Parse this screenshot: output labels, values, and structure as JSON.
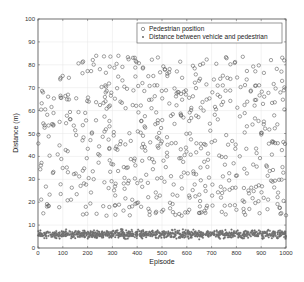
{
  "chart_data": {
    "type": "scatter",
    "title": "",
    "xlabel": "Episode",
    "ylabel": "Distance (m)",
    "xlim": [
      0,
      1000
    ],
    "ylim": [
      0,
      100
    ],
    "xticks": [
      0,
      100,
      200,
      300,
      400,
      500,
      600,
      700,
      800,
      900,
      1000
    ],
    "yticks": [
      0,
      10,
      20,
      30,
      40,
      50,
      60,
      70,
      80,
      90,
      100
    ],
    "grid": true,
    "legend_position": "upper right (inside)",
    "series": [
      {
        "name": "Pedestrian position",
        "marker": "open circle",
        "color": "#555555",
        "n_points": 1000,
        "x_range": [
          1,
          1000
        ],
        "y_range": [
          14,
          84
        ],
        "distribution": "approximately uniform random between ~15 m and ~83 m"
      },
      {
        "name": "Distance between vehicle and pedestrian",
        "marker": "small dot",
        "color": "#666666",
        "n_points": 1000,
        "x_range": [
          1,
          1000
        ],
        "y_range": [
          3.5,
          8.5
        ],
        "mean": 6,
        "distribution": "dense band centred near 6 m (approx 4–8 m)"
      }
    ]
  },
  "legend": {
    "items": [
      {
        "label": "Pedestrian position",
        "marker": "o"
      },
      {
        "label": "Distance between vehicle and pedestrian",
        "marker": "•"
      }
    ]
  },
  "axes": {
    "x_title": "Episode",
    "y_title": "Distance (m)",
    "x_tick_labels": [
      "0",
      "100",
      "200",
      "300",
      "400",
      "500",
      "600",
      "700",
      "800",
      "900",
      "1000"
    ],
    "y_tick_labels": [
      "0",
      "10",
      "20",
      "30",
      "40",
      "50",
      "60",
      "70",
      "80",
      "90",
      "100"
    ]
  },
  "render": {
    "plot_left": 38,
    "plot_top": 19,
    "plot_right": 286,
    "plot_bottom": 248,
    "grid_color": "#e6e6e6",
    "axis_color": "#555555",
    "ped_seed": 12345,
    "dist_seed": 6789,
    "ped_count": 600,
    "dist_count": 1000
  }
}
